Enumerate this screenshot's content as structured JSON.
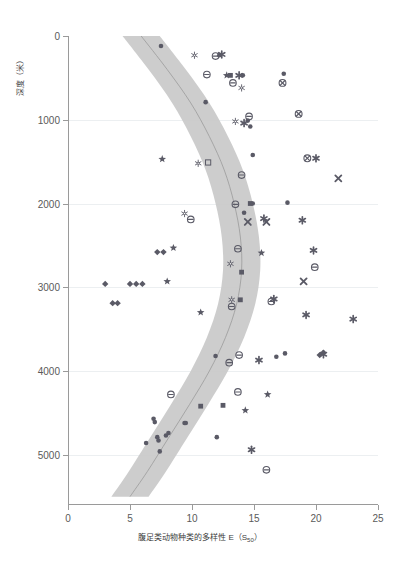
{
  "axes": {
    "y_title": "深度（米）",
    "x_title_main": "腹足类动物种类的多样性 E（S",
    "x_title_sub": "50",
    "x_title_tail": "）",
    "y_ticks": [
      0,
      1000,
      2000,
      3000,
      4000,
      5000
    ],
    "x_ticks": [
      0,
      5,
      10,
      15,
      20,
      25
    ]
  },
  "colors": {
    "band": "#c9c9c9",
    "trend_line": "#9b9b9b",
    "marker": "#5a5a66",
    "axis": "#9a9a9a",
    "grid": "#eceff1",
    "text": "#5a5a5a"
  },
  "chart_data": {
    "type": "scatter",
    "title": "",
    "xlabel": "腹足类动物种类的多样性 E（S50）",
    "ylabel": "深度（米）",
    "xlim": [
      0,
      25
    ],
    "ylim": [
      0,
      5600
    ],
    "y_inverted": true,
    "grid": true,
    "legend": "none",
    "band": {
      "description": "shaded confidence envelope around fitted trend",
      "center": [
        {
          "x": 5.9,
          "y": 0
        },
        {
          "x": 8.0,
          "y": 400
        },
        {
          "x": 9.9,
          "y": 800
        },
        {
          "x": 11.4,
          "y": 1200
        },
        {
          "x": 12.6,
          "y": 1600
        },
        {
          "x": 13.4,
          "y": 2000
        },
        {
          "x": 13.9,
          "y": 2400
        },
        {
          "x": 14.0,
          "y": 2800
        },
        {
          "x": 13.6,
          "y": 3200
        },
        {
          "x": 12.7,
          "y": 3600
        },
        {
          "x": 11.4,
          "y": 4000
        },
        {
          "x": 9.8,
          "y": 4400
        },
        {
          "x": 8.1,
          "y": 4800
        },
        {
          "x": 6.4,
          "y": 5200
        },
        {
          "x": 5.0,
          "y": 5500
        }
      ],
      "half_width": 1.5
    },
    "series": [
      {
        "name": "filled-circle",
        "marker": "circle",
        "points": [
          {
            "x": 7.5,
            "y": 120
          },
          {
            "x": 12.2,
            "y": 230
          },
          {
            "x": 14.1,
            "y": 470
          },
          {
            "x": 17.4,
            "y": 450
          },
          {
            "x": 11.1,
            "y": 790
          },
          {
            "x": 14.5,
            "y": 1010
          },
          {
            "x": 14.7,
            "y": 1080
          },
          {
            "x": 14.9,
            "y": 1420
          },
          {
            "x": 14.2,
            "y": 2110
          },
          {
            "x": 17.7,
            "y": 1990
          },
          {
            "x": 11.9,
            "y": 3820
          },
          {
            "x": 16.8,
            "y": 3830
          },
          {
            "x": 17.5,
            "y": 3790
          },
          {
            "x": 14.9,
            "y": 2000
          },
          {
            "x": 6.3,
            "y": 4860
          },
          {
            "x": 7.0,
            "y": 4610
          },
          {
            "x": 7.2,
            "y": 4790
          },
          {
            "x": 7.3,
            "y": 4830
          },
          {
            "x": 7.4,
            "y": 4960
          },
          {
            "x": 7.9,
            "y": 4770
          },
          {
            "x": 8.1,
            "y": 4740
          },
          {
            "x": 9.4,
            "y": 4620
          },
          {
            "x": 9.5,
            "y": 4620
          },
          {
            "x": 12.0,
            "y": 4790
          },
          {
            "x": 6.9,
            "y": 4570
          }
        ]
      },
      {
        "name": "circle-minus",
        "marker": "circle-minus",
        "points": [
          {
            "x": 11.9,
            "y": 240
          },
          {
            "x": 11.2,
            "y": 460
          },
          {
            "x": 13.3,
            "y": 560
          },
          {
            "x": 14.6,
            "y": 960
          },
          {
            "x": 14.0,
            "y": 1660
          },
          {
            "x": 13.5,
            "y": 2010
          },
          {
            "x": 9.9,
            "y": 2190
          },
          {
            "x": 13.7,
            "y": 2540
          },
          {
            "x": 13.2,
            "y": 3230
          },
          {
            "x": 16.4,
            "y": 3170
          },
          {
            "x": 19.9,
            "y": 2760
          },
          {
            "x": 13.0,
            "y": 3900
          },
          {
            "x": 13.8,
            "y": 3810
          },
          {
            "x": 8.3,
            "y": 4280
          },
          {
            "x": 13.7,
            "y": 4250
          },
          {
            "x": 16.0,
            "y": 5180
          }
        ]
      },
      {
        "name": "star",
        "marker": "star",
        "points": [
          {
            "x": 7.6,
            "y": 1470
          },
          {
            "x": 8.5,
            "y": 2530
          },
          {
            "x": 8.0,
            "y": 2930
          },
          {
            "x": 10.7,
            "y": 3300
          },
          {
            "x": 12.8,
            "y": 470
          },
          {
            "x": 16.1,
            "y": 4280
          },
          {
            "x": 14.3,
            "y": 4470
          },
          {
            "x": 15.6,
            "y": 2590
          }
        ]
      },
      {
        "name": "diamond",
        "marker": "diamond",
        "points": [
          {
            "x": 3.0,
            "y": 2960
          },
          {
            "x": 3.6,
            "y": 3190
          },
          {
            "x": 4.0,
            "y": 3190
          },
          {
            "x": 5.0,
            "y": 2960
          },
          {
            "x": 5.5,
            "y": 2960
          },
          {
            "x": 6.0,
            "y": 2960
          },
          {
            "x": 7.2,
            "y": 2580
          },
          {
            "x": 7.7,
            "y": 2580
          },
          {
            "x": 20.3,
            "y": 3810
          },
          {
            "x": 20.6,
            "y": 3780
          }
        ]
      },
      {
        "name": "filled-square",
        "marker": "square",
        "points": [
          {
            "x": 13.1,
            "y": 470
          },
          {
            "x": 14.7,
            "y": 2000
          },
          {
            "x": 14.0,
            "y": 2820
          },
          {
            "x": 13.9,
            "y": 3150
          },
          {
            "x": 10.7,
            "y": 4420
          },
          {
            "x": 12.5,
            "y": 4410
          }
        ]
      },
      {
        "name": "bold-asterisk",
        "marker": "asterisk",
        "points": [
          {
            "x": 13.8,
            "y": 470
          },
          {
            "x": 14.2,
            "y": 1040
          },
          {
            "x": 20.0,
            "y": 1460
          },
          {
            "x": 18.9,
            "y": 2200
          },
          {
            "x": 19.8,
            "y": 2560
          },
          {
            "x": 15.8,
            "y": 2180
          },
          {
            "x": 16.6,
            "y": 3140
          },
          {
            "x": 19.2,
            "y": 3330
          },
          {
            "x": 23.0,
            "y": 3380
          },
          {
            "x": 20.6,
            "y": 3800
          },
          {
            "x": 15.4,
            "y": 3870
          },
          {
            "x": 14.8,
            "y": 4940
          },
          {
            "x": 12.4,
            "y": 220
          }
        ]
      },
      {
        "name": "circle-cross",
        "marker": "circle-cross",
        "points": [
          {
            "x": 17.3,
            "y": 560
          },
          {
            "x": 18.6,
            "y": 930
          },
          {
            "x": 19.3,
            "y": 1460
          }
        ]
      },
      {
        "name": "x-cross",
        "marker": "x-cross",
        "points": [
          {
            "x": 21.8,
            "y": 1700
          },
          {
            "x": 14.5,
            "y": 2220
          },
          {
            "x": 16.0,
            "y": 2220
          },
          {
            "x": 19.0,
            "y": 2930
          }
        ]
      },
      {
        "name": "open-snowflake",
        "marker": "snowflake",
        "points": [
          {
            "x": 10.2,
            "y": 230
          },
          {
            "x": 14.0,
            "y": 620
          },
          {
            "x": 13.5,
            "y": 1020
          },
          {
            "x": 10.5,
            "y": 1520
          },
          {
            "x": 9.4,
            "y": 2120
          },
          {
            "x": 13.1,
            "y": 2720
          },
          {
            "x": 13.2,
            "y": 3150
          }
        ]
      },
      {
        "name": "open-square",
        "marker": "open-square",
        "points": [
          {
            "x": 11.3,
            "y": 1510
          }
        ]
      }
    ]
  }
}
